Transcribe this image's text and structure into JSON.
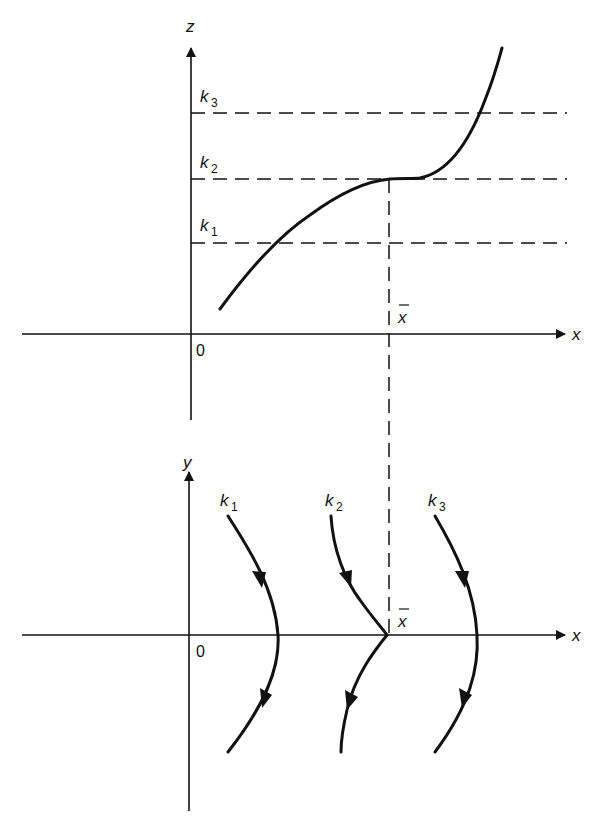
{
  "colors": {
    "ink": "#111111",
    "background": "#ffffff"
  },
  "upper_panel": {
    "vertical_axis_label": "z",
    "horizontal_axis_label": "x",
    "origin_label": "0",
    "xbar_label": "x",
    "levels": [
      {
        "label": "k",
        "sub": "3"
      },
      {
        "label": "k",
        "sub": "2"
      },
      {
        "label": "k",
        "sub": "1"
      }
    ]
  },
  "lower_panel": {
    "vertical_axis_label": "y",
    "horizontal_axis_label": "x",
    "origin_label": "0",
    "xbar_label": "x",
    "trajectories": [
      {
        "label": "k",
        "sub": "1"
      },
      {
        "label": "k",
        "sub": "2"
      },
      {
        "label": "k",
        "sub": "3"
      }
    ]
  }
}
